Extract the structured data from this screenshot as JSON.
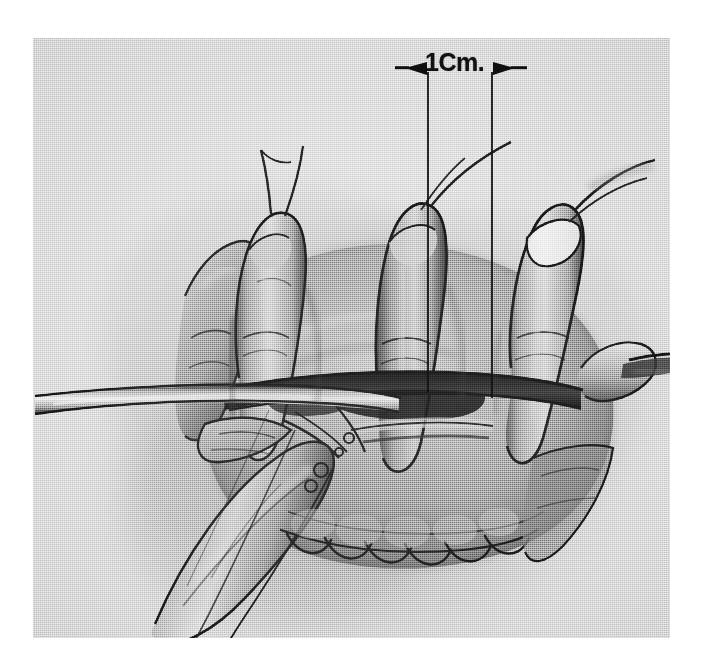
{
  "figure": {
    "kind": "halftone-printed surgical illustration",
    "medium": "graphite and wash drawing reproduced as a monochrome halftone plate",
    "plate": {
      "background_color": "#d4d4d4",
      "paper_color": "#ffffff",
      "ink_color": "#111111",
      "mid_tone": "#8a8a8a",
      "deep_shadow": "#1d1d1d",
      "highlight": "#e9e9e9"
    }
  },
  "annotation": {
    "measure_label": "1Cm.",
    "measure_value": "1",
    "measure_unit": "Cm.",
    "leader_line_color": "#141414",
    "arrow_direction_left": "points-right",
    "arrow_direction_right": "points-left",
    "leader_left_x": 395,
    "leader_right_x": 459,
    "leader_top_y": 34,
    "leader_bottom_y": 355
  },
  "scene": {
    "elements": [
      {
        "name": "index-finger",
        "label": "Index finger, flexed and elevated"
      },
      {
        "name": "middle-finger",
        "label": "Middle finger"
      },
      {
        "name": "ring-finger",
        "label": "Ring finger"
      },
      {
        "name": "little-finger",
        "label": "Little finger"
      },
      {
        "name": "thumb",
        "label": "Thumb, abducted toward lower left"
      },
      {
        "name": "palmar-incision",
        "label": "Transverse palmar incision"
      },
      {
        "name": "flat-retractor-left",
        "label": "Flat blade retractor entering from the left"
      },
      {
        "name": "retractor-right",
        "label": "Retractor blade exiting to the right"
      },
      {
        "name": "suture-line",
        "label": "Running suture loops along the distal palmar crease"
      },
      {
        "name": "skin-flap",
        "label": "Reflected skin flap"
      },
      {
        "name": "caliper-lines",
        "label": "Paired vertical caliper lines marking one centimetre"
      }
    ]
  }
}
